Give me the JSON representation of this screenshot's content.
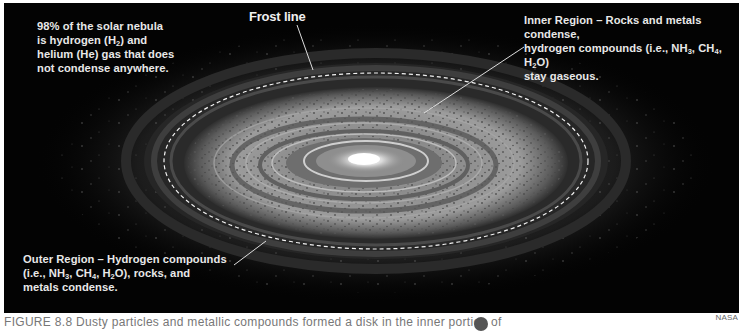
{
  "figure": {
    "labels": {
      "nebula_composition": {
        "lines": [
          "98% of the solar nebula",
          "is hydrogen (H",
          "2",
          ") and",
          "helium (He) gas that does",
          "not condense anywhere."
        ]
      },
      "frost_line": "Frost line",
      "inner_region": {
        "line1": "Inner Region – Rocks and metals condense,",
        "line2_a": "hydrogen compounds (i.e., NH",
        "line2_b": "3",
        "line2_c": ", CH",
        "line2_d": "4",
        "line2_e": ", H",
        "line2_f": "2",
        "line2_g": "O)",
        "line3": "stay gaseous."
      },
      "outer_region": {
        "line1": "Outer Region – Hydrogen compounds",
        "line2_a": "(i.e., NH",
        "line2_b": "3",
        "line2_c": ", CH",
        "line2_d": "4",
        "line2_e": ", H",
        "line2_f": "2",
        "line2_g": "O), rocks, and",
        "line3": "metals condense."
      }
    },
    "caption": "FIGURE 8.8  Dusty particles and metallic compounds formed a disk in the inner portion of",
    "credit": "NASA",
    "colors": {
      "background": "#030303",
      "label_text": "#e8e8e8",
      "frost_line_dash": "#f2f2f2",
      "disk_light": "#9a9a9a",
      "disk_dark": "#3a3a3a",
      "core": "#f5f5f5"
    }
  }
}
